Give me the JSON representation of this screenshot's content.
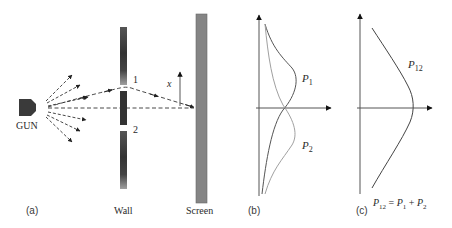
{
  "panel_a": {
    "label": "(a)",
    "gun_label": "GUN",
    "wall_label": "Wall",
    "screen_label": "Screen",
    "slit1_label": "1",
    "slit2_label": "2",
    "axis_label": "x"
  },
  "panel_b": {
    "label": "(b)",
    "curve1_label_main": "P",
    "curve1_label_sub": "1",
    "curve2_label_main": "P",
    "curve2_label_sub": "2"
  },
  "panel_c": {
    "label": "(c)",
    "curve_label_main": "P",
    "curve_label_sub": "12",
    "equation": {
      "lhs_main": "P",
      "lhs_sub": "12",
      "eq": " = ",
      "t1_main": "P",
      "t1_sub": "1",
      "plus": " + ",
      "t2_main": "P",
      "t2_sub": "2"
    }
  },
  "colors": {
    "gun": "#3a3a3a",
    "wall_dark": "#3c3c3c",
    "wall_light": "#9a9a9a",
    "screen": "#808080",
    "axis": "#555555",
    "curve_dark": "#555555",
    "curve_light": "#9a9a9a"
  }
}
